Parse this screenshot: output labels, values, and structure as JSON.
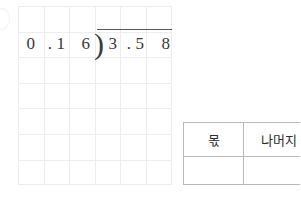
{
  "worksheet": {
    "background_color": "#ffffff",
    "grid": {
      "name": "squared-paper-grid",
      "columns": 6,
      "rows": 7,
      "cell_size_px": 25.6,
      "line_color": "#ededf0"
    },
    "division_problem": {
      "notation": "long-division",
      "divisor": "0.16",
      "dividend": "3.58",
      "divisor_cells": [
        "0",
        ".",
        "1",
        "6"
      ],
      "dividend_cells": [
        "3",
        ".",
        "5",
        "8"
      ],
      "bracket_glyph": ")",
      "text_color": "#383838",
      "vinculum_color": "#58585e"
    }
  },
  "answer_table": {
    "headers": [
      "몫",
      "나머지"
    ],
    "rows": [
      [
        "",
        ""
      ]
    ],
    "border_color": "#b9b9bd"
  }
}
